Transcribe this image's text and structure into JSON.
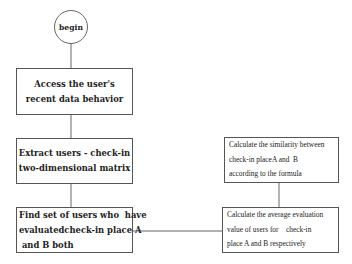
{
  "diagram": {
    "type": "flowchart",
    "start": {
      "label": "begin"
    },
    "nodes": [
      {
        "id": "access",
        "lines": [
          "Access the user's",
          "recent data behavior"
        ]
      },
      {
        "id": "extract",
        "lines": [
          "Extract users - check-in",
          "two-dimensional matrix"
        ]
      },
      {
        "id": "find",
        "lines": [
          "Find set of users who  have",
          "evaluatedcheck-in place A",
          " and B both"
        ]
      },
      {
        "id": "similarity",
        "lines": [
          "Calculate the similarity between",
          "check-in placeA and  B",
          "according to the formula"
        ]
      },
      {
        "id": "average",
        "lines": [
          "Calculate the average evaluation",
          "value of users for    check-in",
          "place A and B respectively"
        ]
      }
    ],
    "edges": [
      [
        "begin",
        "access"
      ],
      [
        "access",
        "extract"
      ],
      [
        "extract",
        "find"
      ],
      [
        "find",
        "average"
      ],
      [
        "average",
        "similarity"
      ]
    ],
    "colors": {
      "line": "#555555",
      "text": "#222222",
      "background": "#ffffff"
    }
  }
}
